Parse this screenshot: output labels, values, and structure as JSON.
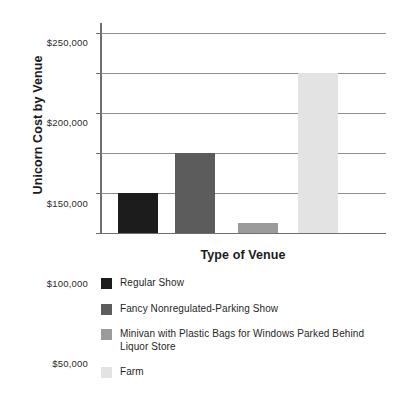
{
  "chart_data": {
    "type": "bar",
    "title": "",
    "xlabel": "Type of Venue",
    "ylabel": "Unicorn Cost by Venue",
    "categories": [
      "Regular Show",
      "Fancy Nonregulated-Parking Show",
      "Minivan with Plastic Bags for Windows Parked Behind Liquor Store",
      "Farm"
    ],
    "values": [
      50000,
      100000,
      12500,
      200000
    ],
    "ylim": [
      0,
      262000
    ],
    "yticks": [
      0,
      50000,
      100000,
      150000,
      200000,
      250000
    ],
    "ytick_labels": [
      "0",
      "$50,000",
      "$100,000",
      "$150,000",
      "$200,000",
      "$250,000"
    ],
    "grid": true,
    "legend_position": "below",
    "colors": [
      "#1c1c1c",
      "#5c5c5c",
      "#9b9b9b",
      "#e3e3e3"
    ]
  },
  "axis": {
    "y_title": "Unicorn Cost by Venue",
    "x_title": "Type of Venue"
  },
  "ticks": [
    {
      "label": "$250,000",
      "value": 250000
    },
    {
      "label": "$200,000",
      "value": 200000
    },
    {
      "label": "$150,000",
      "value": 150000
    },
    {
      "label": "$100,000",
      "value": 100000
    },
    {
      "label": "$50,000",
      "value": 50000
    },
    {
      "label": "0",
      "value": 0
    }
  ],
  "legend": {
    "items": [
      {
        "label": "Regular Show",
        "color": "#1c1c1c"
      },
      {
        "label": "Fancy Nonregulated-Parking Show",
        "color": "#5c5c5c"
      },
      {
        "label": "Minivan with Plastic Bags for Windows Parked Behind Liquor Store",
        "color": "#9b9b9b"
      },
      {
        "label": "Farm",
        "color": "#e3e3e3"
      }
    ]
  }
}
